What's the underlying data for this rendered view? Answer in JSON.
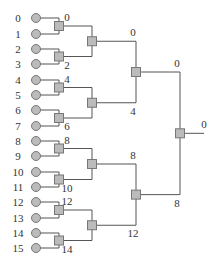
{
  "diagram": {
    "type": "binary-reduction-tree",
    "leaves": [
      {
        "label": "0",
        "y": 18
      },
      {
        "label": "1",
        "y": 34
      },
      {
        "label": "2",
        "y": 49
      },
      {
        "label": "3",
        "y": 64
      },
      {
        "label": "4",
        "y": 80
      },
      {
        "label": "5",
        "y": 95
      },
      {
        "label": "6",
        "y": 110
      },
      {
        "label": "7",
        "y": 126
      },
      {
        "label": "8",
        "y": 141
      },
      {
        "label": "9",
        "y": 156
      },
      {
        "label": "10",
        "y": 172
      },
      {
        "label": "11",
        "y": 187
      },
      {
        "label": "12",
        "y": 202
      },
      {
        "label": "13",
        "y": 218
      },
      {
        "label": "14",
        "y": 233
      },
      {
        "label": "15",
        "y": 248
      }
    ],
    "level1": [
      {
        "top_label": "0",
        "bottom_label": "2"
      },
      {
        "top_label": "4",
        "bottom_label": "6"
      },
      {
        "top_label": "8",
        "bottom_label": "10"
      },
      {
        "top_label": "12",
        "bottom_label": "14"
      }
    ],
    "level2": [
      {
        "top_label": "0",
        "bottom_label": "4"
      },
      {
        "top_label": "8",
        "bottom_label": "12"
      }
    ],
    "level3": {
      "top_label": "0",
      "bottom_label": "8"
    },
    "output_label": "0",
    "colors": {
      "line": "#555555",
      "node_fill": "#bbbbbb",
      "node_stroke": "#777777",
      "text": "#333333"
    }
  }
}
